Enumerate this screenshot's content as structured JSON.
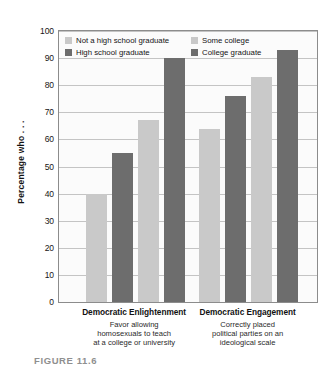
{
  "caption": "FIGURE 11.6",
  "chart_data": {
    "type": "bar",
    "title": "",
    "xlabel": "",
    "ylabel": "Percentage who . . .",
    "ylim": [
      0,
      100
    ],
    "yticks": [
      0,
      10,
      20,
      30,
      40,
      50,
      60,
      70,
      80,
      90,
      100
    ],
    "grid": true,
    "legend_position": "top-inside",
    "categories": [
      "Democratic Enlightenment",
      "Democratic Engagement"
    ],
    "category_descriptions": [
      [
        "Favor allowing",
        "homosexuals to teach",
        "at a college or university"
      ],
      [
        "Correctly placed",
        "political parties on an",
        "ideological scale"
      ]
    ],
    "series": [
      {
        "name": "Not a high school graduate",
        "color": "#c9c9c9",
        "values": [
          40,
          64
        ]
      },
      {
        "name": "High school graduate",
        "color": "#6d6d6d",
        "values": [
          55,
          76
        ]
      },
      {
        "name": "Some college",
        "color": "#c9c9c9",
        "values": [
          67,
          83
        ]
      },
      {
        "name": "College graduate",
        "color": "#6d6d6d",
        "values": [
          90,
          93
        ]
      }
    ]
  }
}
